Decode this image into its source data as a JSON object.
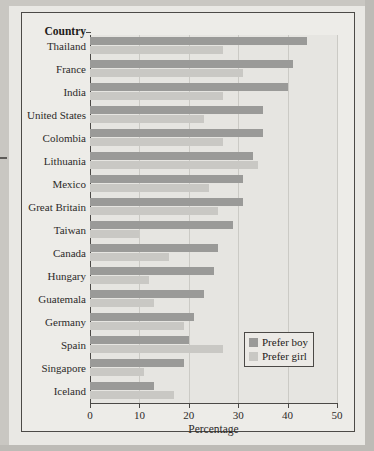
{
  "figure": {
    "y_axis_header": "Country",
    "legend": {
      "items": [
        {
          "label": "Prefer boy",
          "color": "#9a9a98"
        },
        {
          "label": "Prefer girl",
          "color": "#c9c8c4"
        }
      ]
    }
  },
  "chart_data": {
    "type": "bar",
    "orientation": "horizontal",
    "title": "",
    "xlabel": "Percentage",
    "ylabel": "Country",
    "xlim": [
      0,
      50
    ],
    "xticks": [
      0,
      10,
      20,
      30,
      40,
      50
    ],
    "grid": true,
    "legend_position": "inside-bottom-right",
    "categories": [
      "Thailand",
      "France",
      "India",
      "United States",
      "Colombia",
      "Lithuania",
      "Mexico",
      "Great Britain",
      "Taiwan",
      "Canada",
      "Hungary",
      "Guatemala",
      "Germany",
      "Spain",
      "Singapore",
      "Iceland"
    ],
    "series": [
      {
        "name": "Prefer boy",
        "color": "#9a9a98",
        "values": [
          44,
          41,
          40,
          35,
          35,
          33,
          31,
          31,
          29,
          26,
          25,
          23,
          21,
          20,
          19,
          13
        ]
      },
      {
        "name": "Prefer girl",
        "color": "#c9c8c4",
        "values": [
          27,
          31,
          27,
          23,
          27,
          34,
          24,
          26,
          10,
          16,
          12,
          13,
          19,
          27,
          11,
          17
        ]
      }
    ]
  }
}
